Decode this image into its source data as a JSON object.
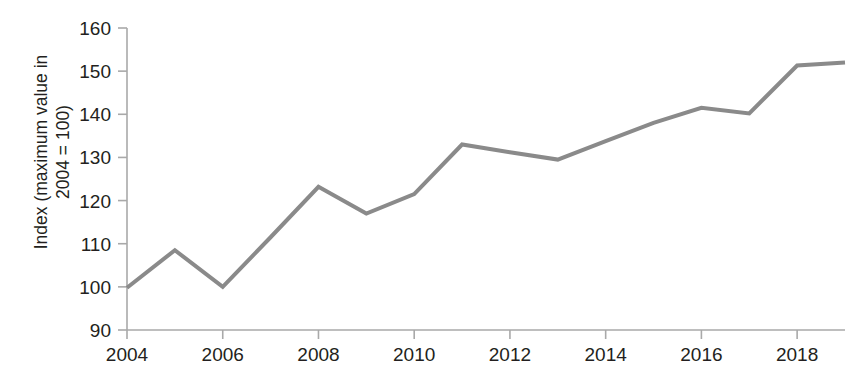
{
  "chart_data": {
    "type": "line",
    "title": "",
    "xlabel": "",
    "ylabel": "Index (maximum value in\n2004 = 100)",
    "ylabel_line1": "Index (maximum value in",
    "ylabel_line2": "2004 = 100)",
    "x": [
      2004,
      2005,
      2006,
      2007,
      2008,
      2009,
      2010,
      2011,
      2012,
      2013,
      2014,
      2015,
      2016,
      2017,
      2018,
      2019
    ],
    "values": [
      99.8,
      108.5,
      100.0,
      111.5,
      123.2,
      117.0,
      121.5,
      133.0,
      131.2,
      129.5,
      133.8,
      138.0,
      141.5,
      140.2,
      151.3,
      152.0
    ],
    "series": [
      {
        "name": "Index",
        "values": [
          99.8,
          108.5,
          100.0,
          111.5,
          123.2,
          117.0,
          121.5,
          133.0,
          131.2,
          129.5,
          133.8,
          138.0,
          141.5,
          140.2,
          151.3,
          152.0
        ]
      }
    ],
    "xlim": [
      2004,
      2019
    ],
    "ylim": [
      90,
      160
    ],
    "y_ticks": [
      90,
      100,
      110,
      120,
      130,
      140,
      150,
      160
    ],
    "y_tick_labels": [
      "90",
      "100",
      "110",
      "120",
      "130",
      "140",
      "150",
      "160"
    ],
    "x_ticks": [
      2004,
      2006,
      2008,
      2010,
      2012,
      2014,
      2016,
      2018
    ],
    "x_tick_labels": [
      "2004",
      "2006",
      "2008",
      "2010",
      "2012",
      "2014",
      "2016",
      "2018"
    ],
    "grid": false,
    "legend": false,
    "legend_position": "none",
    "line_color": "#8a8a8a",
    "axis_color": "#a9a9a9",
    "text_color": "#231f20",
    "line_width": 4
  }
}
